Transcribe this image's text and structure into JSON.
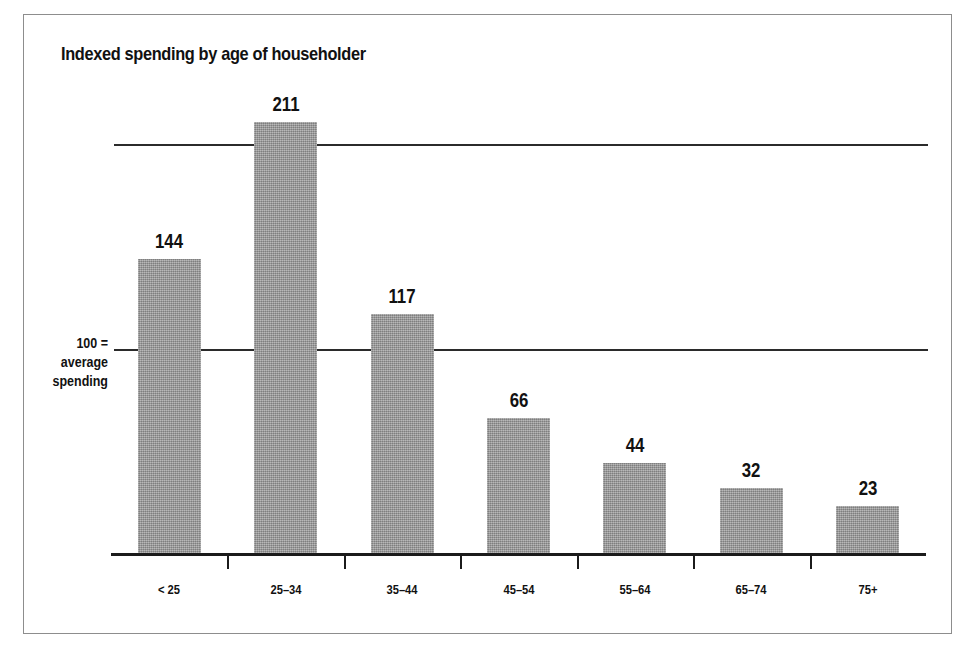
{
  "chart_data": {
    "type": "bar",
    "title": "Indexed spending by age of householder",
    "xlabel": "",
    "ylabel": "",
    "categories": [
      "< 25",
      "25–34",
      "35–44",
      "45–54",
      "55–64",
      "65–74",
      "75+"
    ],
    "values": [
      144,
      211,
      117,
      66,
      44,
      32,
      23
    ],
    "value_labels": [
      "144",
      "211",
      "117",
      "66",
      "44",
      "32",
      "23"
    ],
    "ylim": [
      0,
      230
    ],
    "gridlines": [
      100,
      200
    ],
    "grid": true,
    "legend": null,
    "annotations": {
      "baseline_note_line1": "100 =",
      "baseline_note_line2": "average",
      "baseline_note_line3": "spending"
    },
    "colors": {
      "bar_fill": "#9b9b9b",
      "axis": "#1b1b1b",
      "gridline": "#2b2b2b",
      "text": "#111111",
      "frame_border": "#8d8d8d",
      "background": "#ffffff"
    }
  }
}
